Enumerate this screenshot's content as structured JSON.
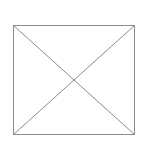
{
  "diagram": {
    "type": "placeholder-box-with-diagonals",
    "stroke_color": "#8a8a8a",
    "background": "#ffffff",
    "box": {
      "x": 13.5,
      "y": 25.5,
      "width": 121,
      "height": 109
    }
  }
}
